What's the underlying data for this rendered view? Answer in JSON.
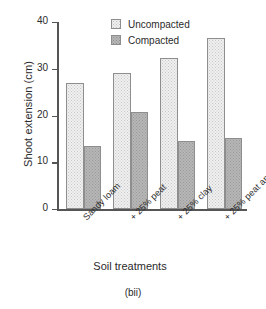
{
  "chart_data": {
    "type": "bar",
    "title": "",
    "caption": "(bii)",
    "xlabel": "Soil treatments",
    "ylabel": "Shoot extension (cm)",
    "categories": [
      "Sandy loam",
      "+ 25% peat",
      "+ 25% clay",
      "+ 25% peat and clay"
    ],
    "series": [
      {
        "name": "Uncompacted",
        "values": [
          27.0,
          29.0,
          32.3,
          36.5
        ],
        "color": "#f0f0f0",
        "pattern": "light-dotted"
      },
      {
        "name": "Compacted",
        "values": [
          13.5,
          20.8,
          14.5,
          15.2
        ],
        "color": "#b6b6b6",
        "pattern": "dark-dotted"
      }
    ],
    "ylim": [
      0,
      40
    ],
    "yticks": [
      0,
      10,
      20,
      30,
      40
    ],
    "ytick_labels": [
      "0",
      "10",
      "20",
      "30",
      "40"
    ],
    "grid": false,
    "legend_position": "top-center"
  },
  "legend": {
    "items": [
      {
        "label": "Uncompacted"
      },
      {
        "label": "Compacted"
      }
    ]
  }
}
